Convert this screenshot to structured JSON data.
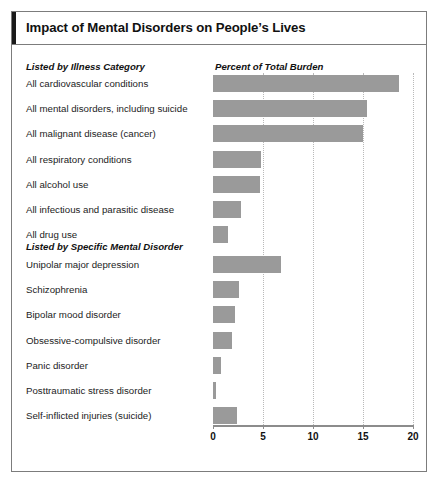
{
  "title": "Impact of Mental Disorders on People’s Lives",
  "headers": {
    "left": "Listed by Illness Category",
    "right": "Percent of Total Burden"
  },
  "group2_header": "Listed by Specific Mental Disorder",
  "axis": {
    "ticks": [
      "0",
      "5",
      "10",
      "15",
      "20"
    ]
  },
  "colors": {
    "bar": "#9a9a9a",
    "frame": "#7c7c7c",
    "accent": "#1a1a1a",
    "gridline": "#b9b9b9",
    "axis": "#8c8c8c"
  },
  "chart_data": {
    "type": "bar",
    "orientation": "horizontal",
    "title": "Impact of Mental Disorders on People’s Lives",
    "xlabel": "Percent of Total Burden",
    "ylabel": "",
    "xlim": [
      0,
      20
    ],
    "xticks": [
      0,
      5,
      10,
      15,
      20
    ],
    "grid": "vertical-dotted",
    "legend": "none",
    "groups": [
      {
        "name": "Listed by Illness Category",
        "categories": [
          "All cardiovascular conditions",
          "All mental disorders, including suicide",
          "All malignant disease (cancer)",
          "All respiratory conditions",
          "All alcohol use",
          "All  infectious and parasitic disease",
          "All drug use"
        ],
        "values": [
          18.6,
          15.4,
          15.0,
          4.8,
          4.7,
          2.8,
          1.5
        ]
      },
      {
        "name": "Listed by Specific Mental Disorder",
        "categories": [
          "Unipolar major depression",
          "Schizophrenia",
          "Bipolar mood disorder",
          "Obsessive-compulsive disorder",
          "Panic disorder",
          "Posttraumatic stress disorder",
          "Self-inflicted injuries (suicide)"
        ],
        "values": [
          6.8,
          2.6,
          2.2,
          1.9,
          0.8,
          0.3,
          2.4
        ]
      }
    ]
  }
}
